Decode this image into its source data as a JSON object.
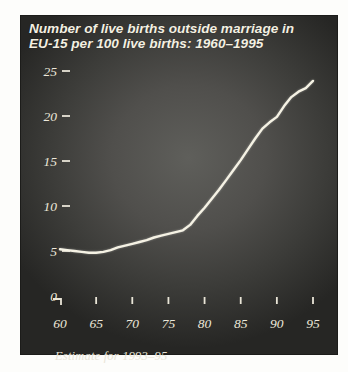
{
  "panel": {
    "title_line1": "Number of live births outside marriage in",
    "title_line2": "EU-15 per 100 live births: 1960–1995",
    "footnote": "Estimate for 1993–95",
    "colors": {
      "page_background": "#fdfdfb",
      "panel_center": "#5f5f5b",
      "panel_edge": "#262624",
      "title_text": "#f4f0e2",
      "axis_text": "#ece8da",
      "line": "#f5f2e4"
    }
  },
  "chart_data": {
    "type": "line",
    "title": "Number of live births outside marriage in EU-15 per 100 live births: 1960–1995",
    "xlabel": "",
    "ylabel": "",
    "x": [
      1960,
      1961,
      1962,
      1963,
      1964,
      1965,
      1966,
      1967,
      1968,
      1969,
      1970,
      1971,
      1972,
      1973,
      1974,
      1975,
      1976,
      1977,
      1978,
      1979,
      1980,
      1981,
      1982,
      1983,
      1984,
      1985,
      1986,
      1987,
      1988,
      1989,
      1990,
      1991,
      1992,
      1993,
      1994,
      1995
    ],
    "values": [
      5.2,
      5.1,
      5.0,
      4.9,
      4.8,
      4.8,
      4.9,
      5.1,
      5.4,
      5.6,
      5.8,
      6.0,
      6.2,
      6.5,
      6.7,
      6.9,
      7.1,
      7.3,
      7.9,
      8.9,
      9.8,
      10.8,
      11.8,
      12.9,
      14.0,
      15.1,
      16.3,
      17.5,
      18.6,
      19.3,
      19.9,
      21.1,
      22.1,
      22.7,
      23.1,
      23.9
    ],
    "xlim": [
      1960,
      1995
    ],
    "ylim": [
      0,
      25
    ],
    "x_ticks": [
      1960,
      1965,
      1970,
      1975,
      1980,
      1985,
      1990,
      1995
    ],
    "x_tick_labels": [
      "60",
      "65",
      "70",
      "75",
      "80",
      "85",
      "90",
      "95"
    ],
    "y_ticks": [
      0,
      5,
      10,
      15,
      20,
      25
    ],
    "y_tick_labels": [
      "0",
      "5",
      "10",
      "15",
      "20",
      "25"
    ],
    "grid": false,
    "legend_position": null,
    "annotation": "Estimate for 1993–95"
  }
}
